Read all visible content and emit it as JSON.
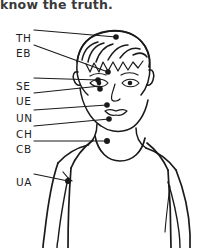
{
  "caption": {
    "text": "know the truth."
  },
  "diagram": {
    "stroke_color": "#1a1a1a",
    "background_color": "#ffffff",
    "point_marker": "filled-dot"
  },
  "labels": [
    {
      "id": "TH",
      "text": "TH",
      "name": "top-of-head",
      "x": 16,
      "y": 32,
      "point_x": 116,
      "point_y": 37
    },
    {
      "id": "EB",
      "text": "EB",
      "name": "eyebrow",
      "x": 16,
      "y": 47,
      "point_x": 108,
      "point_y": 72
    },
    {
      "id": "SE",
      "text": "SE",
      "name": "side-of-eye",
      "x": 16,
      "y": 80,
      "point_x": 98,
      "point_y": 80
    },
    {
      "id": "UE",
      "text": "UE",
      "name": "under-eye",
      "x": 16,
      "y": 95,
      "point_x": 100,
      "point_y": 86
    },
    {
      "id": "UN",
      "text": "UN",
      "name": "under-nose",
      "x": 16,
      "y": 112,
      "point_x": 107,
      "point_y": 105
    },
    {
      "id": "CH",
      "text": "CH",
      "name": "chin",
      "x": 16,
      "y": 128,
      "point_x": 109,
      "point_y": 119
    },
    {
      "id": "CB",
      "text": "CB",
      "name": "collarbone",
      "x": 16,
      "y": 143,
      "point_x": 107,
      "point_y": 141
    },
    {
      "id": "UA",
      "text": "UA",
      "name": "under-arm",
      "x": 16,
      "y": 176,
      "point_x": 68,
      "point_y": 181
    }
  ]
}
